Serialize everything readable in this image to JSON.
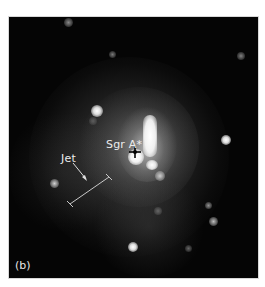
{
  "figure": {
    "panel_label": "(b)",
    "annotations": {
      "source_label": "Sgr A*",
      "jet_label": "Jet"
    },
    "colors": {
      "background": "#050505",
      "nebula": "#8a8a8a",
      "text": "#ececec",
      "frame": "#ffffff"
    }
  }
}
